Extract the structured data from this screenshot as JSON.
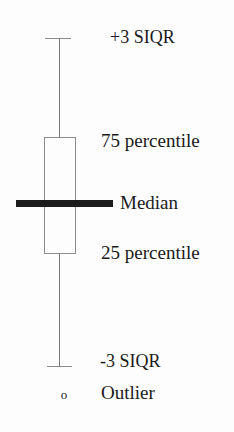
{
  "figure": {
    "type": "box-and-whisker-plot-legend",
    "background_color": "#fdfdfd",
    "ink_color": "#1a1a1a",
    "line_color": "#8a8a8a"
  },
  "labels": {
    "upper_fence": "+3 SIQR",
    "percentile_75": "75 percentile",
    "median": "Median",
    "percentile_25": "25 percentile",
    "lower_fence": "-3 SIQR",
    "outlier": "Outlier"
  },
  "markers": {
    "outlier_glyph": "o"
  },
  "chart_data": {
    "type": "box",
    "title": "",
    "xlabel": "",
    "ylabel": "",
    "orientation": "vertical",
    "grid": false,
    "legend": "right-of-glyph",
    "annotations": [
      {
        "name": "upper-fence",
        "text": "+3 SIQR",
        "marker": "whisker-cap-top"
      },
      {
        "name": "percentile-75",
        "text": "75 percentile",
        "marker": "box-top-edge"
      },
      {
        "name": "median",
        "text": "Median",
        "marker": "thick-horizontal-bar"
      },
      {
        "name": "percentile-25",
        "text": "25 percentile",
        "marker": "box-bottom-edge"
      },
      {
        "name": "lower-fence",
        "text": "-3 SIQR",
        "marker": "whisker-cap-bottom"
      },
      {
        "name": "outlier",
        "text": "Outlier",
        "marker": "open-circle"
      }
    ],
    "series": [
      {
        "name": "schematic-box",
        "upper_fence": "+3 SIQR",
        "q3": "75 percentile",
        "median": "Median",
        "q1": "25 percentile",
        "lower_fence": "-3 SIQR",
        "outliers": [
          "o"
        ]
      }
    ]
  }
}
